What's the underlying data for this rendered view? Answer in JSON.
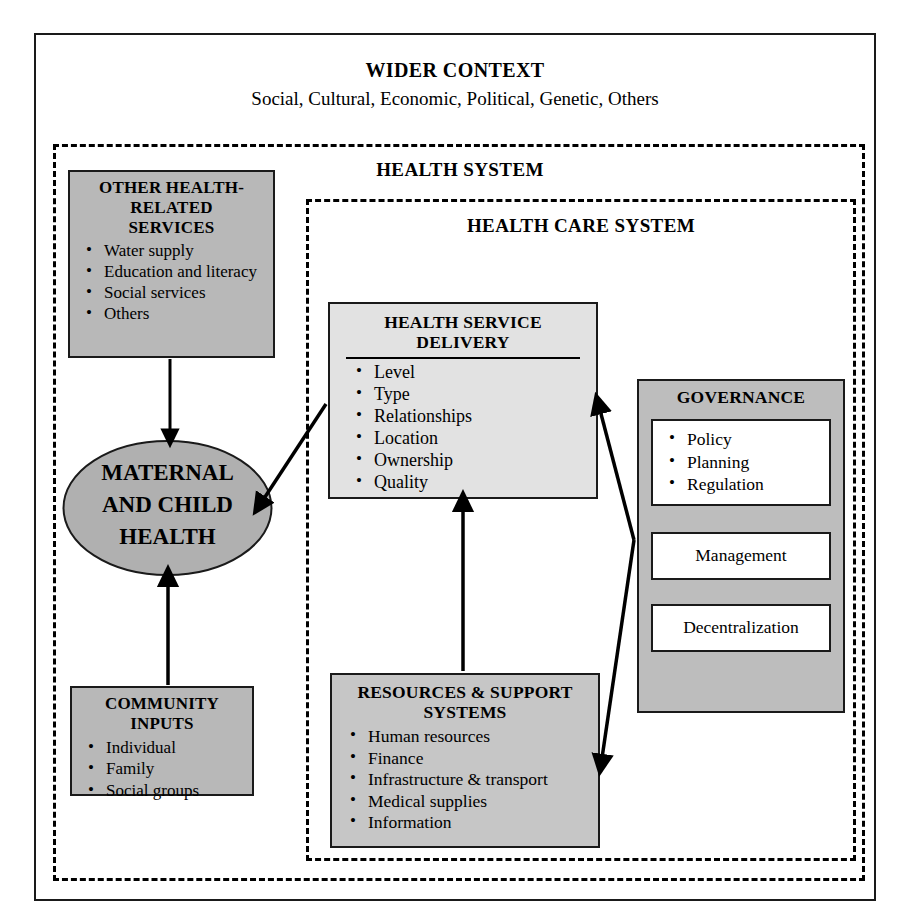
{
  "diagram": {
    "outer_frame_label": "",
    "wider_context": {
      "title": "WIDER CONTEXT",
      "subtitle": "Social, Cultural, Economic, Political, Genetic, Others"
    },
    "health_system_label": "HEALTH SYSTEM",
    "health_care_system_label": "HEALTH CARE SYSTEM",
    "boxes": {
      "other_health_related_services": {
        "title": "OTHER HEALTH-RELATED SERVICES",
        "title_lines": [
          "OTHER HEALTH-",
          "RELATED",
          "SERVICES"
        ],
        "items": [
          "Water supply",
          "Education and literacy",
          "Social services",
          "Others"
        ],
        "fill": "#b8b8b8"
      },
      "maternal_and_child_health": {
        "title": "MATERNAL AND CHILD HEALTH",
        "title_lines": [
          "MATERNAL",
          "AND CHILD",
          "HEALTH"
        ],
        "shape": "ellipse",
        "fill": "#b0b0b0"
      },
      "community_inputs": {
        "title": "COMMUNITY INPUTS",
        "title_lines": [
          "COMMUNITY",
          "INPUTS"
        ],
        "items": [
          "Individual",
          "Family",
          "Social groups"
        ],
        "fill": "#b8b8b8"
      },
      "health_service_delivery": {
        "title": "HEALTH SERVICE DELIVERY",
        "title_lines": [
          "HEALTH SERVICE",
          "DELIVERY"
        ],
        "items": [
          "Level",
          "Type",
          "Relationships",
          "Location",
          "Ownership",
          "Quality"
        ],
        "fill": "#e2e2e2"
      },
      "resources_and_support_systems": {
        "title": "RESOURCES & SUPPORT SYSTEMS",
        "title_lines": [
          "RESOURCES & SUPPORT",
          "SYSTEMS"
        ],
        "items": [
          "Human resources",
          "Finance",
          "Infrastructure & transport",
          "Medical supplies",
          "Information"
        ],
        "fill": "#c6c6c6"
      },
      "governance": {
        "title": "GOVERNANCE",
        "fill": "#bdbdbd",
        "sub_boxes": [
          {
            "type": "list",
            "items": [
              "Policy",
              "Planning",
              "Regulation"
            ]
          },
          {
            "type": "single",
            "label": "Management"
          },
          {
            "type": "single",
            "label": "Decentralization"
          }
        ]
      }
    },
    "arrows": [
      {
        "from": "other_health_related_services",
        "to": "maternal_and_child_health",
        "direction": "down"
      },
      {
        "from": "community_inputs",
        "to": "maternal_and_child_health",
        "direction": "up"
      },
      {
        "from": "health_service_delivery",
        "to": "maternal_and_child_health",
        "direction": "down-left"
      },
      {
        "from": "resources_and_support_systems",
        "to": "health_service_delivery",
        "direction": "up"
      },
      {
        "from": "governance",
        "to": "health_service_delivery",
        "direction": "up-left"
      },
      {
        "from": "governance",
        "to": "resources_and_support_systems",
        "direction": "down-left"
      }
    ],
    "colors": {
      "line": "#000000",
      "frame": "#1a1a1a",
      "page_background": "#ffffff"
    }
  }
}
